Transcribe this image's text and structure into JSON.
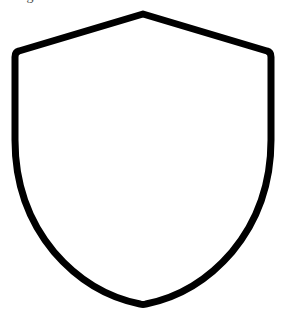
{
  "page": {
    "width": 285,
    "height": 310,
    "background_color": "#ffffff"
  },
  "caption": {
    "text": "Figure 1 — Heraldic shield outline",
    "color": "#4a4a4a",
    "note": "clipped at top edge of frame"
  },
  "figure": {
    "name": "shield-outline",
    "shape": "shield",
    "stroke_color": "#000000",
    "fill_color": "none",
    "stroke_width": 7,
    "geometry": {
      "apex": [
        143,
        14
      ],
      "left_shoulder": [
        17,
        53
      ],
      "right_shoulder": [
        270,
        53
      ],
      "bottom_point": [
        143,
        305
      ],
      "left_side_straight_until_y": 150,
      "right_side_straight_until_y": 150
    }
  }
}
